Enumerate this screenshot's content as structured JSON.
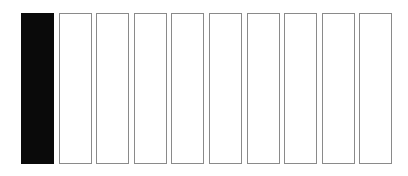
{
  "diagram": {
    "cells": [
      {
        "filled": true
      },
      {
        "filled": false
      },
      {
        "filled": false
      },
      {
        "filled": false
      },
      {
        "filled": false
      },
      {
        "filled": false
      },
      {
        "filled": false
      },
      {
        "filled": false
      },
      {
        "filled": false
      },
      {
        "filled": false
      }
    ],
    "colors": {
      "filled": "#0a0a0a",
      "empty": "#ffffff",
      "border": "#8a8a8a"
    }
  }
}
